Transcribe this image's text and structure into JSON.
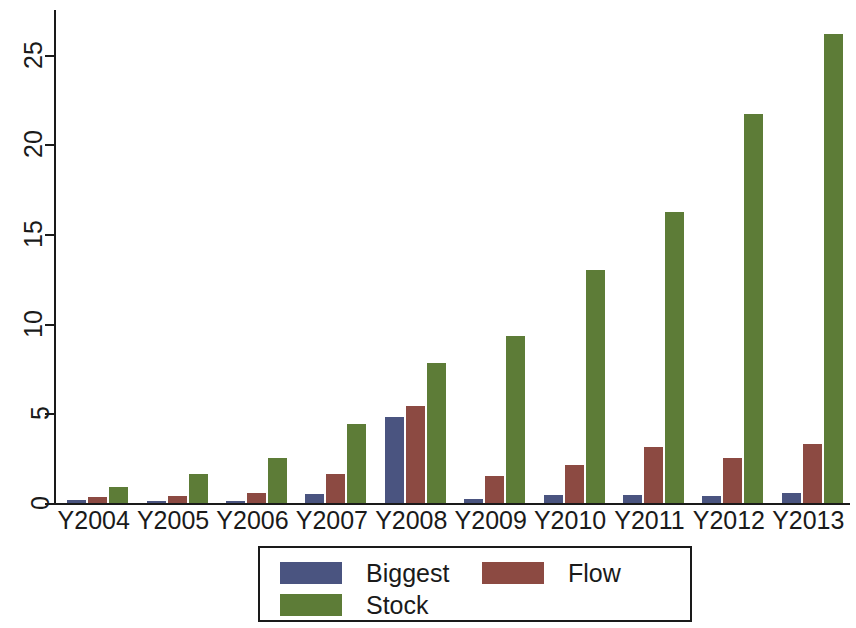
{
  "chart_data": {
    "type": "bar",
    "title": "",
    "subtitle": "",
    "xlabel": "",
    "ylabel": "",
    "grid": false,
    "legend_position": "bottom",
    "ylim": [
      0,
      27.5
    ],
    "yticks": [
      0,
      5,
      10,
      15,
      20,
      25
    ],
    "ytick_labels": [
      "0",
      "5",
      "10",
      "15",
      "20",
      "25"
    ],
    "categories": [
      "Y2004",
      "Y2005",
      "Y2006",
      "Y2007",
      "Y2008",
      "Y2009",
      "Y2010",
      "Y2011",
      "Y2012",
      "Y2013"
    ],
    "series": [
      {
        "name": "Biggest",
        "color": "#4a5480",
        "values": [
          0.15,
          0.1,
          0.12,
          0.5,
          4.8,
          0.2,
          0.45,
          0.45,
          0.4,
          0.55
        ]
      },
      {
        "name": "Flow",
        "color": "#8c4a42",
        "values": [
          0.35,
          0.4,
          0.55,
          1.6,
          5.4,
          1.5,
          2.1,
          3.1,
          2.5,
          3.3
        ]
      },
      {
        "name": "Stock",
        "color": "#5d7c37",
        "values": [
          0.9,
          1.6,
          2.5,
          4.4,
          7.8,
          9.3,
          13.0,
          16.25,
          21.7,
          26.15
        ]
      }
    ]
  },
  "legend": {
    "entries": [
      {
        "label": "Biggest",
        "color": "#4a5480"
      },
      {
        "label": "Flow",
        "color": "#8c4a42"
      },
      {
        "label": "Stock",
        "color": "#5d7c37"
      }
    ]
  },
  "axes": {
    "y_axis_name": "value-axis",
    "x_axis_name": "year-axis"
  }
}
